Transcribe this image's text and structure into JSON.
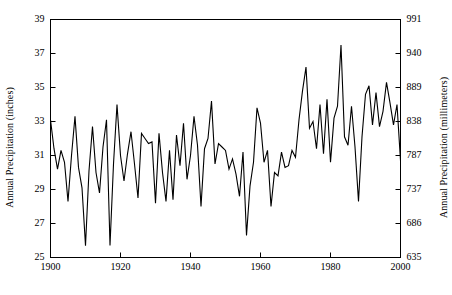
{
  "chart_data": {
    "type": "line",
    "title": "",
    "xlabel": "",
    "ylabel": "Annual Precipitation (inches)",
    "ylabel_right": "Annual Precipitation (millimeters)",
    "grid": false,
    "legend": false,
    "xlim": [
      1900,
      2000
    ],
    "ylim": [
      25,
      39
    ],
    "ylim_right": [
      635,
      991
    ],
    "xticks": [
      1900,
      1920,
      1940,
      1960,
      1980,
      2000
    ],
    "xtick_labels": [
      "1900",
      "1920",
      "1940",
      "1960",
      "1980",
      "2000"
    ],
    "yticks": [
      25,
      27,
      29,
      31,
      33,
      35,
      37,
      39
    ],
    "ytick_labels": [
      "25",
      "27",
      "29",
      "31",
      "33",
      "35",
      "37",
      "39"
    ],
    "yticks_right": [
      635,
      686,
      737,
      787,
      838,
      889,
      940,
      991
    ],
    "ytick_labels_right": [
      "635",
      "686",
      "737",
      "787",
      "838",
      "889",
      "940",
      "991"
    ],
    "line_color": "#000000",
    "line_width": 1.1,
    "x": [
      1900,
      1901,
      1902,
      1903,
      1904,
      1905,
      1906,
      1907,
      1908,
      1909,
      1910,
      1911,
      1912,
      1913,
      1914,
      1915,
      1916,
      1917,
      1918,
      1919,
      1920,
      1921,
      1922,
      1923,
      1924,
      1925,
      1926,
      1927,
      1928,
      1929,
      1930,
      1931,
      1932,
      1933,
      1934,
      1935,
      1936,
      1937,
      1938,
      1939,
      1940,
      1941,
      1942,
      1943,
      1944,
      1945,
      1946,
      1947,
      1948,
      1949,
      1950,
      1951,
      1952,
      1953,
      1954,
      1955,
      1956,
      1957,
      1958,
      1959,
      1960,
      1961,
      1962,
      1963,
      1964,
      1965,
      1966,
      1967,
      1968,
      1969,
      1970,
      1971,
      1972,
      1973,
      1974,
      1975,
      1976,
      1977,
      1978,
      1979,
      1980,
      1981,
      1982,
      1983,
      1984,
      1985,
      1986,
      1987,
      1988,
      1989,
      1990,
      1991,
      1992,
      1993,
      1994,
      1995,
      1996,
      1997,
      1998,
      1999,
      2000
    ],
    "values": [
      33.1,
      31.4,
      30.2,
      31.3,
      30.6,
      28.3,
      31.0,
      33.3,
      30.3,
      29.1,
      25.7,
      30.1,
      32.7,
      30.0,
      28.8,
      31.5,
      33.1,
      25.7,
      30.5,
      34.0,
      31.0,
      29.5,
      31.1,
      32.4,
      30.5,
      28.5,
      32.3,
      32.0,
      31.7,
      31.8,
      28.2,
      32.3,
      30.0,
      28.3,
      31.3,
      28.4,
      32.2,
      30.4,
      32.9,
      29.6,
      31.0,
      33.3,
      31.6,
      28.0,
      31.4,
      32.0,
      34.2,
      30.5,
      31.7,
      31.5,
      31.3,
      30.2,
      30.8,
      29.9,
      28.6,
      31.2,
      26.3,
      29.2,
      30.6,
      33.8,
      32.9,
      30.6,
      31.3,
      28.0,
      30.0,
      29.8,
      31.2,
      30.3,
      30.4,
      31.3,
      30.9,
      33.1,
      34.8,
      36.2,
      32.6,
      33.0,
      31.4,
      34.0,
      31.1,
      34.3,
      30.6,
      33.2,
      33.9,
      37.5,
      32.1,
      31.6,
      33.9,
      31.5,
      28.3,
      32.1,
      34.6,
      35.1,
      32.8,
      34.7,
      32.7,
      33.6,
      35.3,
      34.1,
      32.8,
      34.0,
      30.7
    ]
  }
}
